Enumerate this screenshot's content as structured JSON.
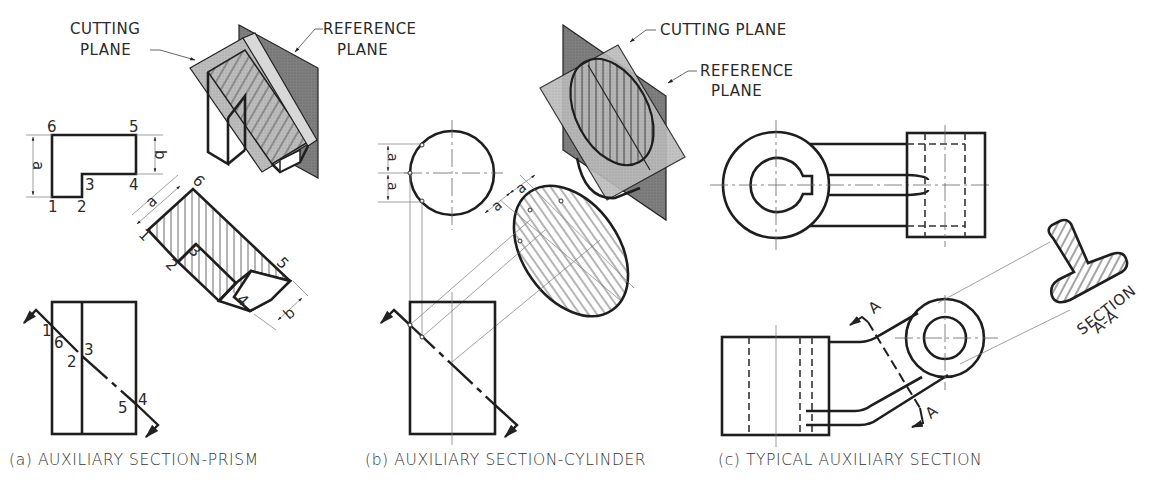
{
  "figure": {
    "panels": [
      {
        "id": "a",
        "caption": "(a) AUXILIARY SECTION-PRISM",
        "labels": {
          "cutting_plane_line1": "CUTTING",
          "cutting_plane_line2": "PLANE",
          "reference_plane_line1": "REFERENCE",
          "reference_plane_line2": "PLANE"
        },
        "points": [
          "1",
          "2",
          "3",
          "4",
          "5",
          "6"
        ],
        "dimensions": [
          "a",
          "b"
        ]
      },
      {
        "id": "b",
        "caption": "(b) AUXILIARY SECTION-CYLINDER",
        "labels": {
          "cutting_plane": "CUTTING PLANE",
          "reference_plane_line1": "REFERENCE",
          "reference_plane_line2": "PLANE"
        },
        "dimensions": [
          "a",
          "a",
          "a",
          "a"
        ]
      },
      {
        "id": "c",
        "caption": "(c) TYPICAL AUXILIARY SECTION",
        "labels": {
          "section_line1": "SECTION",
          "section_line2": "A-A",
          "cut_marker_top": "A",
          "cut_marker_bottom": "A"
        }
      }
    ],
    "text": {
      "pt1": "1",
      "pt2": "2",
      "pt3": "3",
      "pt4": "4",
      "pt5": "5",
      "pt6": "6",
      "dim_a": "a",
      "dim_b": "b"
    },
    "colors": {
      "line": "#1e1e1e",
      "plane_light": "#b9b9b9",
      "plane_dark": "#7a7a7a",
      "face_mid": "#cfcfcf",
      "background": "#ffffff"
    }
  }
}
